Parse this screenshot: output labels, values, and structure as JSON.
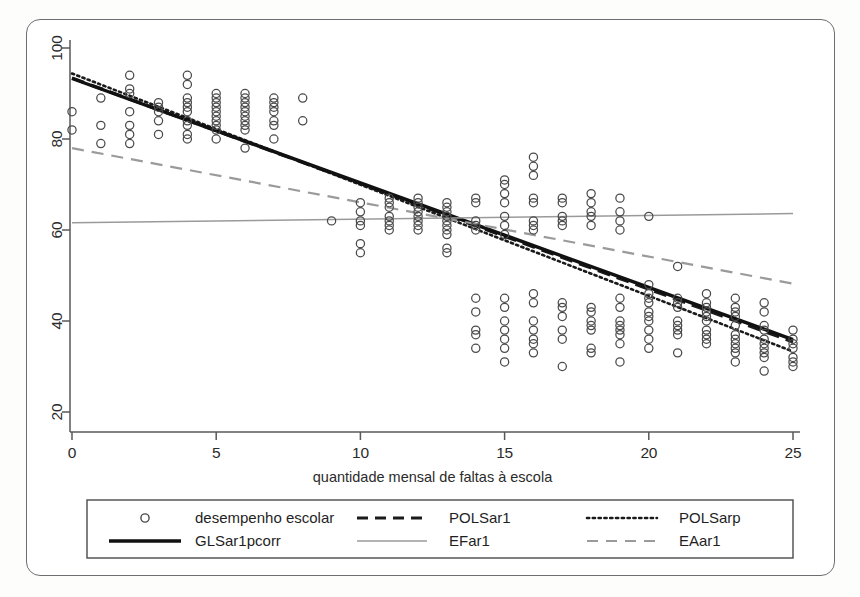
{
  "figure": {
    "background_color": "#fdfdfc",
    "frame_color": "#6e6e72",
    "axis_color": "#585858"
  },
  "chart_data": {
    "type": "scatter",
    "title": "",
    "subtitle": "",
    "xlabel": "quantidade mensal de faltas à escola",
    "ylabel": "",
    "xlim": [
      -0.6,
      25.6
    ],
    "ylim": [
      17,
      103
    ],
    "xticks": [
      0,
      5,
      10,
      15,
      20,
      25
    ],
    "xtick_labels": [
      "0",
      "5",
      "10",
      "15",
      "20",
      "25"
    ],
    "yticks": [
      20,
      40,
      60,
      80,
      100
    ],
    "ytick_labels": [
      "20",
      "40",
      "60",
      "80",
      "100"
    ],
    "grid": false,
    "legend_position": "below-axes",
    "scatter": {
      "name": "desempenho escolar",
      "marker": "open-circle",
      "marker_color": "#4a4a4a",
      "points": [
        [
          0,
          86
        ],
        [
          0,
          82
        ],
        [
          1,
          89
        ],
        [
          1,
          83
        ],
        [
          1,
          79
        ],
        [
          2,
          94
        ],
        [
          2,
          91
        ],
        [
          2,
          90
        ],
        [
          2,
          86
        ],
        [
          2,
          83
        ],
        [
          2,
          81
        ],
        [
          2,
          79
        ],
        [
          3,
          88
        ],
        [
          3,
          87
        ],
        [
          3,
          86
        ],
        [
          3,
          84
        ],
        [
          3,
          81
        ],
        [
          4,
          94
        ],
        [
          4,
          92
        ],
        [
          4,
          89
        ],
        [
          4,
          88
        ],
        [
          4,
          87
        ],
        [
          4,
          86
        ],
        [
          4,
          84
        ],
        [
          4,
          83
        ],
        [
          4,
          81
        ],
        [
          4,
          80
        ],
        [
          5,
          90
        ],
        [
          5,
          89
        ],
        [
          5,
          88
        ],
        [
          5,
          87
        ],
        [
          5,
          86
        ],
        [
          5,
          85
        ],
        [
          5,
          84
        ],
        [
          5,
          83
        ],
        [
          5,
          82
        ],
        [
          5,
          80
        ],
        [
          6,
          90
        ],
        [
          6,
          89
        ],
        [
          6,
          88
        ],
        [
          6,
          87
        ],
        [
          6,
          86
        ],
        [
          6,
          85
        ],
        [
          6,
          84
        ],
        [
          6,
          83
        ],
        [
          6,
          82
        ],
        [
          6,
          78
        ],
        [
          7,
          89
        ],
        [
          7,
          88
        ],
        [
          7,
          87
        ],
        [
          7,
          86
        ],
        [
          7,
          84
        ],
        [
          7,
          83
        ],
        [
          7,
          80
        ],
        [
          8,
          89
        ],
        [
          8,
          84
        ],
        [
          9,
          62
        ],
        [
          10,
          66
        ],
        [
          10,
          64
        ],
        [
          10,
          62
        ],
        [
          10,
          61
        ],
        [
          10,
          57
        ],
        [
          10,
          55
        ],
        [
          11,
          67
        ],
        [
          11,
          66
        ],
        [
          11,
          65
        ],
        [
          11,
          63
        ],
        [
          11,
          62
        ],
        [
          11,
          61
        ],
        [
          11,
          60
        ],
        [
          12,
          67
        ],
        [
          12,
          66
        ],
        [
          12,
          65
        ],
        [
          12,
          64
        ],
        [
          12,
          63
        ],
        [
          12,
          62
        ],
        [
          12,
          61
        ],
        [
          12,
          60
        ],
        [
          13,
          66
        ],
        [
          13,
          65
        ],
        [
          13,
          64
        ],
        [
          13,
          63
        ],
        [
          13,
          62
        ],
        [
          13,
          61
        ],
        [
          13,
          60
        ],
        [
          13,
          59
        ],
        [
          13,
          56
        ],
        [
          13,
          55
        ],
        [
          14,
          67
        ],
        [
          14,
          66
        ],
        [
          14,
          62
        ],
        [
          14,
          61
        ],
        [
          14,
          60
        ],
        [
          14,
          45
        ],
        [
          14,
          42
        ],
        [
          14,
          38
        ],
        [
          14,
          37
        ],
        [
          14,
          34
        ],
        [
          15,
          71
        ],
        [
          15,
          70
        ],
        [
          15,
          68
        ],
        [
          15,
          66
        ],
        [
          15,
          63
        ],
        [
          15,
          61
        ],
        [
          15,
          59
        ],
        [
          15,
          45
        ],
        [
          15,
          43
        ],
        [
          15,
          40
        ],
        [
          15,
          38
        ],
        [
          15,
          36
        ],
        [
          15,
          34
        ],
        [
          15,
          31
        ],
        [
          16,
          76
        ],
        [
          16,
          74
        ],
        [
          16,
          72
        ],
        [
          16,
          67
        ],
        [
          16,
          66
        ],
        [
          16,
          62
        ],
        [
          16,
          61
        ],
        [
          16,
          60
        ],
        [
          16,
          46
        ],
        [
          16,
          44
        ],
        [
          16,
          40
        ],
        [
          16,
          38
        ],
        [
          16,
          36
        ],
        [
          16,
          35
        ],
        [
          16,
          33
        ],
        [
          17,
          67
        ],
        [
          17,
          66
        ],
        [
          17,
          63
        ],
        [
          17,
          62
        ],
        [
          17,
          61
        ],
        [
          17,
          44
        ],
        [
          17,
          43
        ],
        [
          17,
          41
        ],
        [
          17,
          38
        ],
        [
          17,
          36
        ],
        [
          17,
          30
        ],
        [
          18,
          68
        ],
        [
          18,
          66
        ],
        [
          18,
          64
        ],
        [
          18,
          63
        ],
        [
          18,
          61
        ],
        [
          18,
          43
        ],
        [
          18,
          42
        ],
        [
          18,
          40
        ],
        [
          18,
          39
        ],
        [
          18,
          38
        ],
        [
          18,
          34
        ],
        [
          18,
          33
        ],
        [
          19,
          67
        ],
        [
          19,
          64
        ],
        [
          19,
          62
        ],
        [
          19,
          60
        ],
        [
          19,
          45
        ],
        [
          19,
          43
        ],
        [
          19,
          40
        ],
        [
          19,
          39
        ],
        [
          19,
          38
        ],
        [
          19,
          37
        ],
        [
          19,
          35
        ],
        [
          19,
          31
        ],
        [
          20,
          63
        ],
        [
          20,
          48
        ],
        [
          20,
          46
        ],
        [
          20,
          45
        ],
        [
          20,
          44
        ],
        [
          20,
          42
        ],
        [
          20,
          41
        ],
        [
          20,
          40
        ],
        [
          20,
          38
        ],
        [
          20,
          36
        ],
        [
          20,
          34
        ],
        [
          21,
          52
        ],
        [
          21,
          45
        ],
        [
          21,
          44
        ],
        [
          21,
          43
        ],
        [
          21,
          40
        ],
        [
          21,
          39
        ],
        [
          21,
          38
        ],
        [
          21,
          37
        ],
        [
          21,
          33
        ],
        [
          22,
          46
        ],
        [
          22,
          44
        ],
        [
          22,
          43
        ],
        [
          22,
          42
        ],
        [
          22,
          41
        ],
        [
          22,
          40
        ],
        [
          22,
          38
        ],
        [
          22,
          37
        ],
        [
          22,
          36
        ],
        [
          22,
          35
        ],
        [
          23,
          45
        ],
        [
          23,
          43
        ],
        [
          23,
          42
        ],
        [
          23,
          41
        ],
        [
          23,
          39
        ],
        [
          23,
          37
        ],
        [
          23,
          36
        ],
        [
          23,
          35
        ],
        [
          23,
          34
        ],
        [
          23,
          33
        ],
        [
          23,
          31
        ],
        [
          24,
          44
        ],
        [
          24,
          42
        ],
        [
          24,
          39
        ],
        [
          24,
          38
        ],
        [
          24,
          36
        ],
        [
          24,
          35
        ],
        [
          24,
          34
        ],
        [
          24,
          33
        ],
        [
          24,
          32
        ],
        [
          24,
          29
        ],
        [
          25,
          38
        ],
        [
          25,
          36
        ],
        [
          25,
          35
        ],
        [
          25,
          34
        ],
        [
          25,
          32
        ],
        [
          25,
          31
        ],
        [
          25,
          30
        ]
      ]
    },
    "series": [
      {
        "name": "POLSar1",
        "style": "dashed",
        "color": "#1a1a1a",
        "width": 3.2,
        "dasharray": "13,7",
        "x": [
          0,
          25
        ],
        "y": [
          93.4,
          35.4
        ]
      },
      {
        "name": "POLSarp",
        "style": "dotted",
        "color": "#1a1a1a",
        "width": 2.6,
        "dasharray": "2.2,3.4",
        "x": [
          0,
          25
        ],
        "y": [
          94.4,
          33.3
        ]
      },
      {
        "name": "GLSar1pcorr",
        "style": "solid",
        "color": "#111111",
        "width": 3.4,
        "dasharray": "",
        "x": [
          0,
          25
        ],
        "y": [
          93.3,
          35.9
        ]
      },
      {
        "name": "EFar1",
        "style": "solid",
        "color": "#9a9a9a",
        "width": 1.5,
        "dasharray": "",
        "x": [
          0,
          25
        ],
        "y": [
          61.6,
          63.6
        ]
      },
      {
        "name": "EAar1",
        "style": "dashed",
        "color": "#9a9a9a",
        "width": 2.2,
        "dasharray": "12,8",
        "x": [
          0,
          25
        ],
        "y": [
          78.0,
          48.2
        ]
      }
    ]
  },
  "legend": {
    "entries": [
      {
        "label": "desempenho escolar",
        "kind": "marker",
        "color": "#4a4a4a",
        "dash": "",
        "width": 1.4
      },
      {
        "label": "POLSar1",
        "kind": "line",
        "color": "#1a1a1a",
        "dash": "11,7",
        "width": 3.2
      },
      {
        "label": "POLSarp",
        "kind": "line",
        "color": "#1a1a1a",
        "dash": "2.2,3.6",
        "width": 2.6
      },
      {
        "label": "GLSar1pcorr",
        "kind": "line",
        "color": "#111111",
        "dash": "",
        "width": 3.4
      },
      {
        "label": "EFar1",
        "kind": "line",
        "color": "#9a9a9a",
        "dash": "",
        "width": 1.6
      },
      {
        "label": "EAar1",
        "kind": "line",
        "color": "#9a9a9a",
        "dash": "11,8",
        "width": 2.2
      }
    ]
  }
}
